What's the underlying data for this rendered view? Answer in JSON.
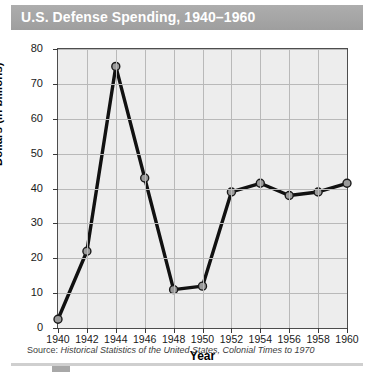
{
  "header": {
    "title": "U.S. Defense Spending, 1940–1960",
    "banner_color": "#a6a6a6",
    "title_color": "#ffffff"
  },
  "chart_data": {
    "type": "line",
    "title": "U.S. Defense Spending, 1940–1960",
    "xlabel": "Year",
    "ylabel": "Dollars (in billions)",
    "x": [
      1940,
      1942,
      1944,
      1946,
      1948,
      1950,
      1952,
      1954,
      1956,
      1958,
      1960
    ],
    "values": [
      2.5,
      22,
      75,
      43,
      11,
      12,
      39,
      41.5,
      38,
      39,
      41.5
    ],
    "xtick_labels": [
      "1940",
      "1942",
      "1944",
      "1946",
      "1948",
      "1950",
      "1952",
      "1954",
      "1956",
      "1958",
      "1960"
    ],
    "ytick_labels": [
      "0",
      "10",
      "20",
      "30",
      "40",
      "50",
      "60",
      "70",
      "80"
    ],
    "ytick_values": [
      0,
      10,
      20,
      30,
      40,
      50,
      60,
      70,
      80
    ],
    "xlim": [
      1940,
      1960
    ],
    "ylim": [
      0,
      80
    ],
    "grid": true,
    "legend": "none",
    "line_color": "#111111",
    "marker_fill": "#9a9a9a",
    "marker_edge": "#1a1a1a",
    "plot_background": "#ededed",
    "gridline_color": "#b9b9b9"
  },
  "footnote": {
    "label": "Source:",
    "citation": "Historical Statistics of the United States, Colonial Times to 1970"
  }
}
